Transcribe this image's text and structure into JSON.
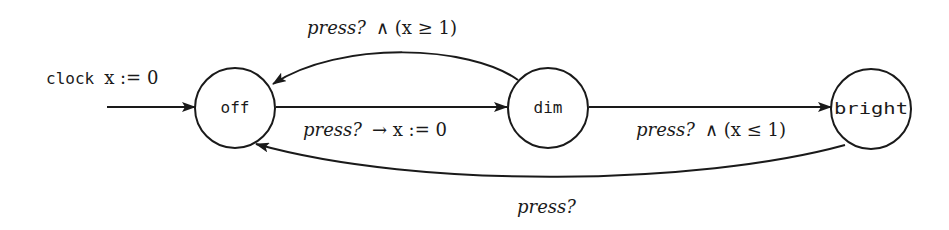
{
  "diagram": {
    "type": "timed-automaton",
    "initial": {
      "label_keyword": "clock",
      "label_expr": "x := 0",
      "target": "off"
    },
    "states": [
      {
        "id": "off",
        "label": "off",
        "cx": 235,
        "cy": 108,
        "r": 40
      },
      {
        "id": "dim",
        "label": "dim",
        "cx": 548,
        "cy": 108,
        "r": 40
      },
      {
        "id": "bright",
        "label": "bright",
        "cx": 871,
        "cy": 109,
        "r": 40
      }
    ],
    "transitions": [
      {
        "id": "dim-to-off",
        "from": "dim",
        "to": "off",
        "event": "press?",
        "guard": "∧ (x ≥ 1)"
      },
      {
        "id": "off-to-dim",
        "from": "off",
        "to": "dim",
        "event": "press?",
        "guard": "→ x := 0"
      },
      {
        "id": "dim-to-bright",
        "from": "dim",
        "to": "bright",
        "event": "press?",
        "guard": "∧ (x ≤ 1)"
      },
      {
        "id": "bright-to-off",
        "from": "bright",
        "to": "off",
        "event": "press?",
        "guard": ""
      }
    ]
  },
  "colors": {
    "stroke": "#1a1a1a",
    "background": "#ffffff"
  }
}
